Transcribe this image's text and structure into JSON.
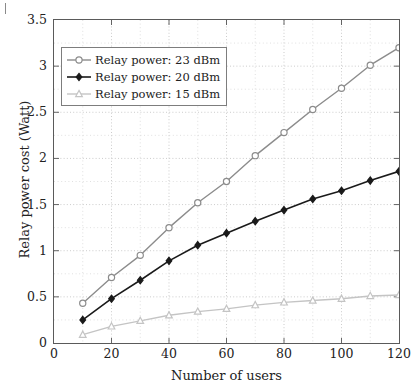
{
  "figure": {
    "axis_title_x": "Number of users",
    "axis_title_y": "Relay power cost (Watt)"
  },
  "chart_data": {
    "type": "line",
    "title": "",
    "xlabel": "Number of users",
    "ylabel": "Relay power cost (Watt)",
    "xlim": [
      0,
      120
    ],
    "ylim": [
      0,
      3.5
    ],
    "xticks": [
      0,
      20,
      40,
      60,
      80,
      100,
      120
    ],
    "yticks": [
      0,
      0.5,
      1,
      1.5,
      2,
      2.5,
      3,
      3.5
    ],
    "xtick_labels": [
      "0",
      "20",
      "40",
      "60",
      "80",
      "100",
      "120"
    ],
    "ytick_labels": [
      "0",
      "0.5",
      "1",
      "1.5",
      "2",
      "2.5",
      "3",
      "3.5"
    ],
    "grid": true,
    "grid_style": "dotted",
    "minor_grid_x_step": 10,
    "minor_grid_y_step": 0.25,
    "legend_position": "upper left",
    "x": [
      10,
      20,
      30,
      40,
      50,
      60,
      70,
      80,
      90,
      100,
      110,
      120
    ],
    "series": [
      {
        "name": "Relay power: 23 dBm",
        "marker": "circle",
        "color": "#8c8c8c",
        "values": [
          0.43,
          0.71,
          0.95,
          1.25,
          1.52,
          1.75,
          2.03,
          2.28,
          2.53,
          2.76,
          3.01,
          3.2
        ]
      },
      {
        "name": "Relay power: 20 dBm",
        "marker": "diamond",
        "color": "#1a1a1a",
        "values": [
          0.25,
          0.48,
          0.68,
          0.89,
          1.06,
          1.19,
          1.32,
          1.44,
          1.56,
          1.65,
          1.76,
          1.86
        ]
      },
      {
        "name": "Relay power: 15 dBm",
        "marker": "triangle",
        "color": "#c4c4c4",
        "values": [
          0.09,
          0.18,
          0.24,
          0.3,
          0.34,
          0.37,
          0.41,
          0.44,
          0.46,
          0.48,
          0.51,
          0.52
        ]
      }
    ]
  }
}
